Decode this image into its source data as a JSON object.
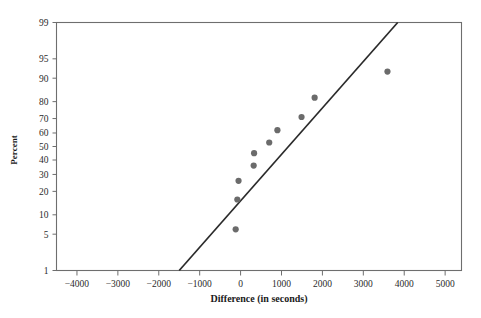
{
  "chart_data": {
    "type": "scatter",
    "title": "",
    "subtitle": "",
    "xlabel": "Difference (in seconds)",
    "ylabel": "Percent",
    "xlim": [
      -4500,
      5400
    ],
    "ylim_percent": [
      1,
      99
    ],
    "grid": false,
    "legend": null,
    "x_ticks": [
      -4000,
      -3000,
      -2000,
      -1000,
      0,
      1000,
      2000,
      3000,
      4000,
      5000
    ],
    "x_tick_labels": [
      "−4000",
      "−3000",
      "−2000",
      "−1000",
      "0",
      "1000",
      "2000",
      "3000",
      "4000",
      "5000"
    ],
    "y_ticks": [
      1,
      5,
      10,
      20,
      30,
      40,
      50,
      60,
      70,
      80,
      90,
      95,
      99
    ],
    "y_tick_labels": [
      "1",
      "5",
      "10",
      "20",
      "30",
      "40",
      "50",
      "60",
      "70",
      "80",
      "90",
      "95",
      "99"
    ],
    "point_color": "#6b6b6b",
    "line_color": "#2a2a2a",
    "axis_color": "#6e6e6e",
    "points": [
      {
        "x": -120,
        "percent": 6
      },
      {
        "x": -80,
        "percent": 16
      },
      {
        "x": -50,
        "percent": 26
      },
      {
        "x": 320,
        "percent": 36
      },
      {
        "x": 330,
        "percent": 45
      },
      {
        "x": 700,
        "percent": 53
      },
      {
        "x": 900,
        "percent": 62
      },
      {
        "x": 1490,
        "percent": 71
      },
      {
        "x": 1810,
        "percent": 82
      },
      {
        "x": 3590,
        "percent": 92
      }
    ],
    "reference_line": {
      "x_start": -1500,
      "percent_start": 1,
      "x_end": 3840,
      "percent_end": 99
    },
    "series": [
      {
        "name": "Difference (in seconds)",
        "x": [
          -120,
          -80,
          -50,
          320,
          330,
          700,
          900,
          1490,
          1810,
          3590
        ],
        "percent": [
          6,
          16,
          26,
          36,
          45,
          53,
          62,
          71,
          82,
          92
        ]
      }
    ]
  }
}
